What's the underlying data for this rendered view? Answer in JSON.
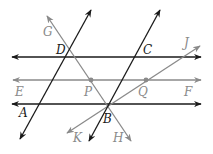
{
  "diagram": {
    "type": "geometry-parallel-lines-transversals",
    "colors": {
      "dark": "#1a1a1a",
      "gray": "#8a8a8a",
      "background": "#ffffff"
    },
    "points": {
      "A": "A",
      "B": "B",
      "C": "C",
      "D": "D",
      "E": "E",
      "F": "F",
      "G": "G",
      "H": "H",
      "J": "J",
      "K": "K",
      "P": "P",
      "Q": "Q"
    },
    "lines": [
      {
        "name": "line-DC",
        "color": "dark",
        "through": [
          "D",
          "C"
        ]
      },
      {
        "name": "line-EF",
        "color": "gray",
        "through": [
          "E",
          "P",
          "Q",
          "F"
        ]
      },
      {
        "name": "line-AB",
        "color": "dark",
        "through": [
          "A",
          "B"
        ]
      },
      {
        "name": "line-AD",
        "color": "dark",
        "through": [
          "A",
          "D"
        ]
      },
      {
        "name": "line-BC",
        "color": "dark",
        "through": [
          "B",
          "C"
        ]
      },
      {
        "name": "line-GH",
        "color": "gray",
        "through": [
          "G",
          "D",
          "P",
          "B",
          "H"
        ]
      },
      {
        "name": "line-JK",
        "color": "gray",
        "through": [
          "J",
          "Q",
          "B",
          "K"
        ]
      }
    ]
  }
}
